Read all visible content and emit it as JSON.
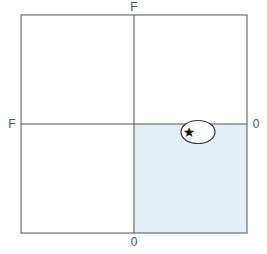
{
  "diagram": {
    "type": "quadrant",
    "labels": {
      "top": "F",
      "left": "F",
      "right": "0",
      "bottom": "0"
    },
    "colors": {
      "line": "#555555",
      "highlight_fill": "#e6eef8",
      "ellipse_fill": "#ffffff",
      "marker": "#111111"
    },
    "highlighted_quadrant": "bottom-right",
    "marker": {
      "shape": "star",
      "glyph": "★",
      "enclosed_by": "ellipse"
    }
  }
}
